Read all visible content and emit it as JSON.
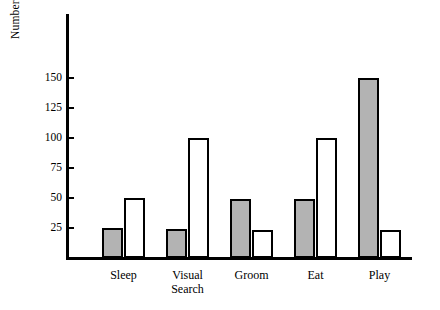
{
  "chart_data": {
    "type": "bar",
    "title": "",
    "subtitle": "",
    "xlabel": "",
    "ylabel": "Number of Observations",
    "categories": [
      "Sleep",
      "Visual\nSearch",
      "Groom",
      "Eat",
      "Play"
    ],
    "series": [
      {
        "name": "filled",
        "color": "#b3b3b3",
        "values": [
          25,
          24,
          49,
          49,
          150
        ]
      },
      {
        "name": "open",
        "color": "#ffffff",
        "values": [
          50,
          100,
          23,
          100,
          23
        ]
      }
    ],
    "ylim": [
      0,
      165
    ],
    "yticks": [
      25,
      50,
      75,
      100,
      125,
      150
    ],
    "ytick_labels": [
      "25",
      "50",
      "75",
      "100",
      "125",
      "150"
    ],
    "grid": false,
    "legend": "none",
    "axis_color": "#000000",
    "bar_outline_color": "#000000"
  }
}
